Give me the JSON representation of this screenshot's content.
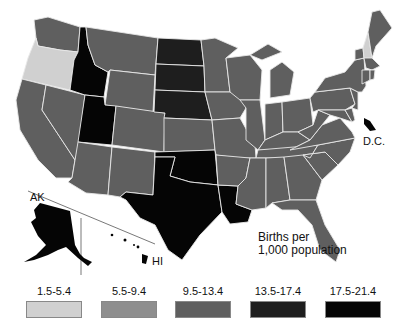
{
  "map": {
    "title": "Births per 1,000 population",
    "caption_line1": "Births per",
    "caption_line2": "1,000 population",
    "labels": {
      "ak": "AK",
      "hi": "HI",
      "dc": "D.C."
    }
  },
  "legend": [
    {
      "range": "1.5-5.4",
      "color": "#d0d0d0"
    },
    {
      "range": "5.5-9.4",
      "color": "#8e8e8e"
    },
    {
      "range": "9.5-13.4",
      "color": "#5f5f5f"
    },
    {
      "range": "13.5-17.4",
      "color": "#1e1e1e"
    },
    {
      "range": "17.5-21.4",
      "color": "#050505"
    }
  ],
  "states": {
    "WA": "9.5-13.4",
    "OR": "1.5-5.4",
    "CA": "9.5-13.4",
    "ID": "17.5-21.4",
    "NV": "9.5-13.4",
    "UT": "17.5-21.4",
    "AZ": "9.5-13.4",
    "MT": "9.5-13.4",
    "WY": "9.5-13.4",
    "CO": "9.5-13.4",
    "NM": "9.5-13.4",
    "ND": "13.5-17.4",
    "SD": "13.5-17.4",
    "NE": "13.5-17.4",
    "KS": "9.5-13.4",
    "OK": "17.5-21.4",
    "TX": "17.5-21.4",
    "LA": "17.5-21.4",
    "MN": "9.5-13.4",
    "IA": "9.5-13.4",
    "MO": "9.5-13.4",
    "AR": "9.5-13.4",
    "WI": "9.5-13.4",
    "IL": "9.5-13.4",
    "MI": "9.5-13.4",
    "IN": "9.5-13.4",
    "OH": "9.5-13.4",
    "KY": "9.5-13.4",
    "TN": "9.5-13.4",
    "MS": "9.5-13.4",
    "AL": "9.5-13.4",
    "GA": "9.5-13.4",
    "FL": "9.5-13.4",
    "SC": "9.5-13.4",
    "NC": "9.5-13.4",
    "VA": "9.5-13.4",
    "WV": "9.5-13.4",
    "PA": "9.5-13.4",
    "NY": "9.5-13.4",
    "VT": "9.5-13.4",
    "NH": "1.5-5.4",
    "ME": "9.5-13.4",
    "MA": "9.5-13.4",
    "CT": "9.5-13.4",
    "RI": "9.5-13.4",
    "NJ": "9.5-13.4",
    "DE": "9.5-13.4",
    "MD": "9.5-13.4",
    "DC": "17.5-21.4",
    "AK": "17.5-21.4",
    "HI": "17.5-21.4"
  }
}
